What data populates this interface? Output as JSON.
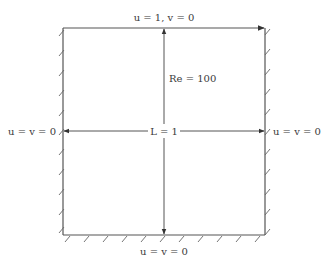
{
  "diagram": {
    "labels": {
      "top_boundary": "u = 1, v = 0",
      "left_boundary": "u = v = 0",
      "right_boundary": "u = v = 0",
      "bottom_boundary": "u = v = 0",
      "reynolds": "Re = 100",
      "length": "L = 1"
    },
    "colors": {
      "line": "#555555",
      "text": "#3a3a3a",
      "background": "#ffffff"
    },
    "box": {
      "x0": 63,
      "y0": 28,
      "x1": 265,
      "y1": 235
    }
  }
}
